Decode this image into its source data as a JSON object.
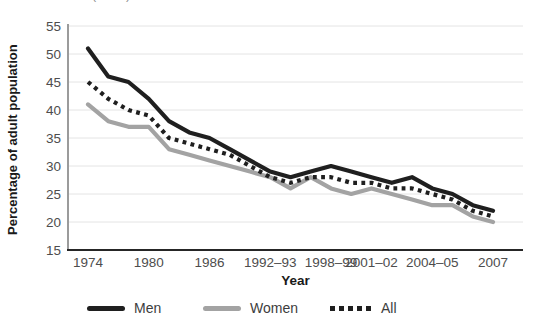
{
  "top_caption": "Source: ONS (2008)",
  "chart_data": {
    "type": "line",
    "title": "",
    "xlabel": "Year",
    "ylabel": "Percentage of adult population",
    "ylim": [
      15,
      55
    ],
    "yticks": [
      15,
      20,
      25,
      30,
      35,
      40,
      45,
      50,
      55
    ],
    "grid": "horizontal",
    "legend_position": "bottom",
    "x_labels": [
      "1974",
      "1976",
      "1978",
      "1980",
      "1982",
      "1984",
      "1986",
      "1988",
      "1990",
      "1992–93",
      "1994–95",
      "1996–97",
      "1998–99",
      "2000–01",
      "2001–02",
      "2002–03",
      "2003–04",
      "2004–05",
      "2005",
      "2006",
      "2007"
    ],
    "xtick_indices": [
      0,
      3,
      6,
      9,
      12,
      14,
      17,
      20
    ],
    "series": [
      {
        "name": "Men",
        "color": "#1f1f1f",
        "style": "solid",
        "values": [
          51,
          46,
          45,
          42,
          38,
          36,
          35,
          33,
          31,
          29,
          28,
          29,
          30,
          29,
          28,
          27,
          28,
          26,
          25,
          23,
          22
        ]
      },
      {
        "name": "Women",
        "color": "#a3a3a3",
        "style": "solid",
        "values": [
          41,
          38,
          37,
          37,
          33,
          32,
          31,
          30,
          29,
          28,
          26,
          28,
          26,
          25,
          26,
          25,
          24,
          23,
          23,
          21,
          20
        ]
      },
      {
        "name": "All",
        "color": "#1f1f1f",
        "style": "dotted",
        "values": [
          45,
          42,
          40,
          39,
          35,
          34,
          33,
          32,
          30,
          28,
          27,
          28,
          28,
          27,
          27,
          26,
          26,
          25,
          24,
          22,
          21
        ]
      }
    ]
  },
  "colors": {
    "grid": "#e4e4e4",
    "y_axis": "#9b9b9b",
    "x_axis": "#262626",
    "tick_text": "#4d4d4d"
  }
}
